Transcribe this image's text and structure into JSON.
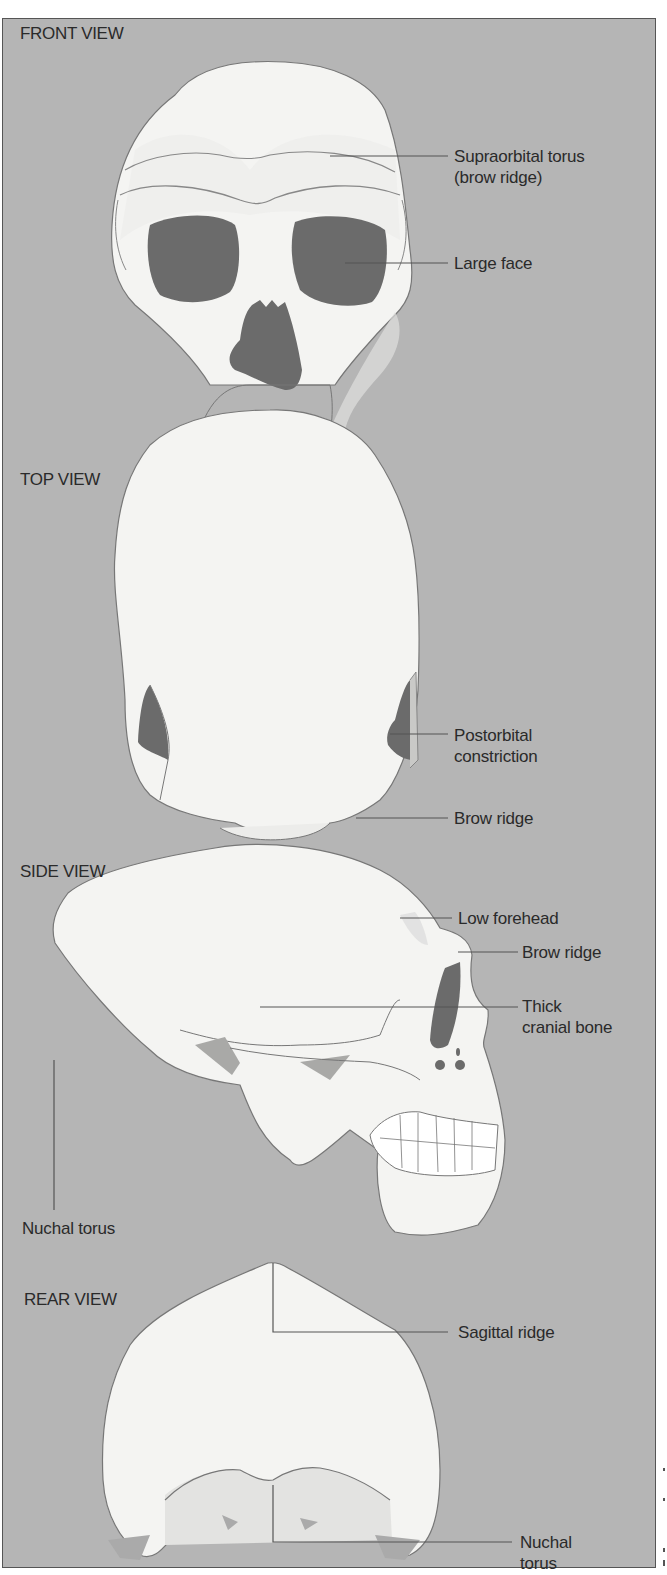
{
  "figure": {
    "colors": {
      "background": "#b5b5b5",
      "bone": "#f4f4f2",
      "bone_shade": "#e3e3e1",
      "cavity": "#6b6b6b",
      "shadow": "#a8a8a8",
      "line": "#555555",
      "text": "#2a2a2a"
    },
    "views": [
      {
        "id": "front",
        "title": "FRONT VIEW",
        "callouts": [
          {
            "lines": [
              "Supraorbital torus",
              "(brow ridge)"
            ]
          },
          {
            "lines": [
              "Large face"
            ]
          }
        ]
      },
      {
        "id": "top",
        "title": "TOP VIEW",
        "callouts": [
          {
            "lines": [
              "Postorbital",
              "constriction"
            ]
          },
          {
            "lines": [
              "Brow ridge"
            ]
          }
        ]
      },
      {
        "id": "side",
        "title": "SIDE VIEW",
        "callouts": [
          {
            "lines": [
              "Low forehead"
            ]
          },
          {
            "lines": [
              "Brow ridge"
            ]
          },
          {
            "lines": [
              "Thick",
              "cranial bone"
            ]
          },
          {
            "lines": [
              "Nuchal torus"
            ]
          }
        ]
      },
      {
        "id": "rear",
        "title": "REAR VIEW",
        "callouts": [
          {
            "lines": [
              "Sagittal ridge"
            ]
          },
          {
            "lines": [
              "Nuchal",
              "torus"
            ]
          }
        ]
      }
    ]
  }
}
